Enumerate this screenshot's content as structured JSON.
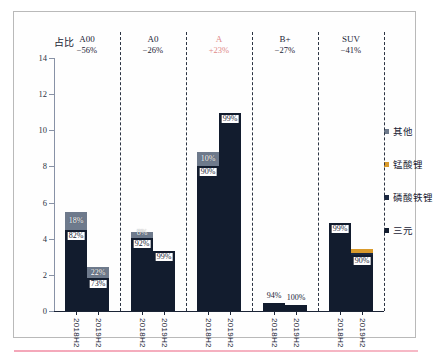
{
  "chart_data": {
    "type": "bar",
    "title": "",
    "ylabel": "占比",
    "xlabel": "",
    "ylim": [
      0,
      14
    ],
    "yticks": [
      0,
      2,
      4,
      6,
      8,
      10,
      12,
      14
    ],
    "grid": false,
    "stacked": true,
    "legend_position": "right",
    "legend": [
      {
        "label": "其他",
        "color": "#6e7a8c"
      },
      {
        "label": "锰酸锂",
        "color": "#d99a2b"
      },
      {
        "label": "磷酸铁锂",
        "color": "#1a2840"
      },
      {
        "label": "三元",
        "color": "#121c2e"
      }
    ],
    "groups": [
      {
        "name": "A00",
        "change": "−56%",
        "accent": false,
        "bars": [
          {
            "x": "2018H2",
            "total": 5.5,
            "segments": [
              {
                "series": "三元",
                "value": 4.5,
                "label": "82%",
                "label_pos": "inside-bottom"
              },
              {
                "series": "其他",
                "value": 1.0,
                "label": "18%",
                "label_pos": "inside-top"
              }
            ]
          },
          {
            "x": "2019H2",
            "total": 2.45,
            "segments": [
              {
                "series": "三元",
                "value": 1.8,
                "label": "73%",
                "label_pos": "inside-bottom"
              },
              {
                "series": "其他",
                "value": 0.65,
                "label": "22%",
                "label_pos": "inside-top"
              }
            ]
          }
        ]
      },
      {
        "name": "A0",
        "change": "−26%",
        "accent": false,
        "bars": [
          {
            "x": "2018H2",
            "total": 4.4,
            "segments": [
              {
                "series": "三元",
                "value": 4.05,
                "label": "92%",
                "label_pos": "inside-bottom"
              },
              {
                "series": "其他",
                "value": 0.35,
                "label": "8%",
                "label_pos": "inside-top"
              }
            ]
          },
          {
            "x": "2019H2",
            "total": 3.3,
            "segments": [
              {
                "series": "三元",
                "value": 3.3,
                "label": "99%",
                "label_pos": "inside-bottom"
              }
            ]
          }
        ]
      },
      {
        "name": "A",
        "change": "+23%",
        "accent": true,
        "bars": [
          {
            "x": "2018H2",
            "total": 8.8,
            "segments": [
              {
                "series": "三元",
                "value": 8.0,
                "label": "90%",
                "label_pos": "inside-bottom"
              },
              {
                "series": "其他",
                "value": 0.8,
                "label": "10%",
                "label_pos": "inside-top"
              }
            ]
          },
          {
            "x": "2019H2",
            "total": 10.95,
            "segments": [
              {
                "series": "三元",
                "value": 10.95,
                "label": "99%",
                "label_pos": "inside-bottom"
              }
            ]
          }
        ]
      },
      {
        "name": "B+",
        "change": "−27%",
        "accent": false,
        "bars": [
          {
            "x": "2018H2",
            "total": 0.45,
            "segments": [
              {
                "series": "三元",
                "value": 0.45,
                "label": "94%",
                "label_pos": "above"
              }
            ]
          },
          {
            "x": "2019H2",
            "total": 0.33,
            "segments": [
              {
                "series": "三元",
                "value": 0.33,
                "label": "100%",
                "label_pos": "above"
              }
            ]
          }
        ]
      },
      {
        "name": "SUV",
        "change": "−41%",
        "accent": false,
        "bars": [
          {
            "x": "2018H2",
            "total": 4.85,
            "segments": [
              {
                "series": "三元",
                "value": 4.85,
                "label": "99%",
                "label_pos": "inside-bottom"
              }
            ]
          },
          {
            "x": "2019H2",
            "total": 3.45,
            "segments": [
              {
                "series": "三元",
                "value": 3.1,
                "label": "90%",
                "label_pos": "inside-bottom"
              },
              {
                "series": "磷酸铁锂",
                "value": 0.13,
                "label": "",
                "label_pos": "none"
              },
              {
                "series": "锰酸锂",
                "value": 0.22,
                "label": "",
                "label_pos": "none"
              }
            ]
          }
        ]
      }
    ]
  },
  "colors": {
    "sanyuan": "#121c2e",
    "lfp": "#1a2840",
    "lmo": "#d99a2b",
    "other": "#6e7a8c",
    "accent": "#e08a8a",
    "axis": "#1b2436",
    "frame": "#b9b9b9"
  }
}
